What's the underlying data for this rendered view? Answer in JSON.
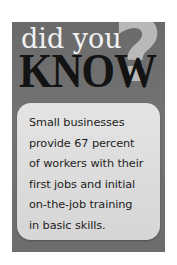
{
  "callout": {
    "headline": {
      "line1": "did you",
      "line2": "KNOW",
      "question_mark": "?"
    },
    "fact": {
      "lines": [
        "Small businesses",
        "provide 67 percent",
        "of workers with their",
        "first jobs and initial",
        "on-the-job training",
        "in basic skills."
      ],
      "full_text": "Small businesses provide 67 percent of workers with their first jobs and initial on-the-job training in basic skills."
    },
    "statistic": {
      "value": "67",
      "unit": "percent"
    },
    "colors": {
      "panel_background": "#6e6e6e",
      "card_background": "#dedede",
      "headline_light_text": "#f2f2f2",
      "headline_dark_text": "#131313",
      "question_mark": "#b9b9b9",
      "fact_text": "#1d1d1d",
      "page_background": "#ffffff"
    }
  }
}
